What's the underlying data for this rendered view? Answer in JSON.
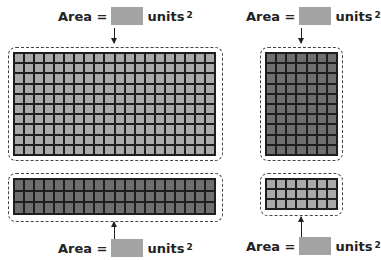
{
  "panels": [
    {
      "id": "top-left",
      "label": {
        "prefix": "Area =",
        "units": "units",
        "exponent": "2"
      },
      "arrow_direction": "down",
      "grid": {
        "columns": 20,
        "rows": 10,
        "shade": "light",
        "color": "#a9a9a9"
      }
    },
    {
      "id": "bottom-left",
      "label": {
        "prefix": "Area =",
        "units": "units",
        "exponent": "2"
      },
      "arrow_direction": "up",
      "grid": {
        "columns": 20,
        "rows": 3,
        "shade": "dark",
        "color": "#6f6f6f"
      }
    },
    {
      "id": "top-right",
      "label": {
        "prefix": "Area =",
        "units": "units",
        "exponent": "2"
      },
      "arrow_direction": "down",
      "grid": {
        "columns": 7,
        "rows": 10,
        "shade": "dark",
        "color": "#6f6f6f"
      }
    },
    {
      "id": "bottom-right",
      "label": {
        "prefix": "Area =",
        "units": "units",
        "exponent": "2"
      },
      "arrow_direction": "up",
      "grid": {
        "columns": 7,
        "rows": 3,
        "shade": "light",
        "color": "#a9a9a9"
      }
    }
  ],
  "answer_box_color": "#a3a3a3"
}
